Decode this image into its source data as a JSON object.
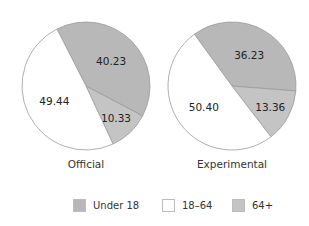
{
  "chart_data": {
    "type": "pie",
    "title": "",
    "legend": {
      "position": "bottom",
      "entries": [
        {
          "label": "Under 18",
          "color": "#b8b8b8"
        },
        {
          "label": "18–64",
          "color": "#ffffff"
        },
        {
          "label": "64+",
          "color": "#c4c4c4"
        }
      ]
    },
    "pies": [
      {
        "label": "Official",
        "categories": [
          "Under 18",
          "64+",
          "18–64"
        ],
        "values": [
          40.23,
          10.33,
          49.44
        ],
        "value_labels": [
          "40.23",
          "10.33",
          "49.44"
        ],
        "colors": [
          "#b8b8b8",
          "#c4c4c4",
          "#ffffff"
        ]
      },
      {
        "label": "Experimental",
        "categories": [
          "Under 18",
          "64+",
          "18–64"
        ],
        "values": [
          36.23,
          13.36,
          50.4
        ],
        "value_labels": [
          "36.23",
          "13.36",
          "50.40"
        ],
        "colors": [
          "#b8b8b8",
          "#c4c4c4",
          "#ffffff"
        ]
      }
    ]
  },
  "layout": {
    "pies": [
      {
        "cx": 86,
        "cy": 86,
        "r": 64,
        "start_deg": -27,
        "title_y": 168
      },
      {
        "cx": 232,
        "cy": 86,
        "r": 64,
        "start_deg": -36,
        "title_y": 168
      }
    ],
    "legend_x": [
      73,
      162,
      232
    ]
  }
}
